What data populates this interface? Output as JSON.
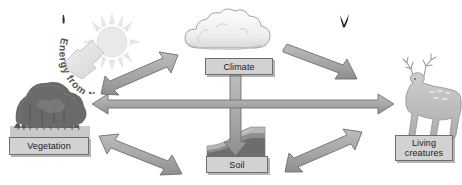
{
  "diagram": {
    "type": "cycle-diagram",
    "background_color": "#ffffff",
    "nodes": [
      {
        "id": "vegetation",
        "label": "Vegetation",
        "icon": "trees-and-grass-illustration",
        "position": "left"
      },
      {
        "id": "climate",
        "label": "Climate",
        "icon": "cloud-illustration",
        "position": "top-center"
      },
      {
        "id": "soil",
        "label": "Soil",
        "icon": "soil-cross-section-illustration",
        "position": "bottom-center"
      },
      {
        "id": "living_creatures",
        "label_line1": "Living",
        "label_line2": "creatures",
        "icon": "deer-illustration",
        "position": "right"
      }
    ],
    "energy_label": {
      "text": "Energy from the sun",
      "icon": "sun-icon",
      "style": "curved-arc-text"
    },
    "connections": [
      {
        "from": "vegetation",
        "to": "climate",
        "style": "double-headed",
        "orientation": "diagonal-up-right"
      },
      {
        "from": "vegetation",
        "to": "living_creatures",
        "style": "double-headed",
        "orientation": "horizontal"
      },
      {
        "from": "vegetation",
        "to": "soil",
        "style": "double-headed",
        "orientation": "diagonal-down-right"
      },
      {
        "from": "climate",
        "to": "living_creatures",
        "style": "single-headed",
        "orientation": "diagonal-down-right"
      },
      {
        "from": "climate",
        "to": "soil",
        "style": "single-headed",
        "orientation": "vertical-down"
      },
      {
        "from": "soil",
        "to": "living_creatures",
        "style": "double-headed",
        "orientation": "diagonal-up-right"
      },
      {
        "from": "sun",
        "to": "vegetation",
        "style": "single-headed",
        "orientation": "diagonal-down-left"
      }
    ],
    "colors": {
      "arrow_fill": "#a8a8a8",
      "arrow_stroke": "#6b6b6b",
      "sun_arrow_fill": "#e2e2e2",
      "label_fill": "#d2d2d2",
      "label_stroke": "#6e6e6e",
      "cloud_fill": "#f2f2f2",
      "sun_fill": "#e8e8e8",
      "vegetation_dark": "#6e6e6e",
      "deer_fill": "#bdbdbd",
      "soil_dark": "#7a7a7a"
    },
    "marks": [
      {
        "id": "mark-left",
        "shape": "small-dark-tick",
        "position": "top-left"
      },
      {
        "id": "mark-right",
        "shape": "small-dark-check",
        "position": "top-right"
      }
    ]
  }
}
